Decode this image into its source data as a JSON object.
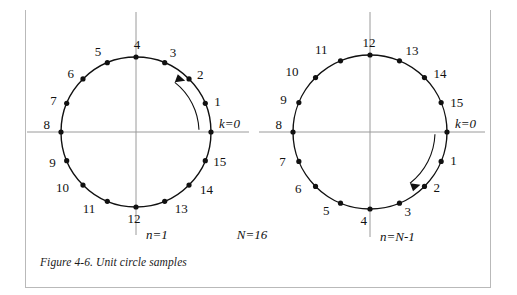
{
  "figure": {
    "caption": "Figure 4-6. Unit circle samples",
    "n_label_total": "N=16",
    "accent_color": "#111111",
    "axis_color": "#9a9a9a"
  },
  "circles": [
    {
      "id": "left-circle",
      "direction": "counterclockwise",
      "direction_label": "n=1",
      "origin_label": "k=0",
      "cx": 136,
      "cy": 132,
      "r": 75,
      "samples": [
        {
          "k": "k=0",
          "index": 0,
          "angle_deg": 0,
          "label": "k=0",
          "label_dx": 8,
          "label_dy": -4
        },
        {
          "k": "1",
          "index": 1,
          "angle_deg": 22.5,
          "label": "1",
          "label_dx": 9,
          "label_dy": 3
        },
        {
          "k": "2",
          "index": 2,
          "angle_deg": 45,
          "label": "2",
          "label_dx": 8,
          "label_dy": 0
        },
        {
          "k": "3",
          "index": 3,
          "angle_deg": 67.5,
          "label": "3",
          "label_dx": 5,
          "label_dy": -6
        },
        {
          "k": "4",
          "index": 4,
          "angle_deg": 90,
          "label": "4",
          "label_dx": 1,
          "label_dy": -8
        },
        {
          "k": "5",
          "index": 5,
          "angle_deg": 112.5,
          "label": "5",
          "label_dx": -6,
          "label_dy": -7
        },
        {
          "k": "6",
          "index": 6,
          "angle_deg": 135,
          "label": "6",
          "label_dx": -9,
          "label_dy": -1
        },
        {
          "k": "7",
          "index": 7,
          "angle_deg": 157.5,
          "label": "7",
          "label_dx": -10,
          "label_dy": 2
        },
        {
          "k": "8",
          "index": 8,
          "angle_deg": 180,
          "label": "8",
          "label_dx": -11,
          "label_dy": -3
        },
        {
          "k": "9",
          "index": 9,
          "angle_deg": 202.5,
          "label": "9",
          "label_dx": -11,
          "label_dy": 6
        },
        {
          "k": "10",
          "index": 10,
          "angle_deg": 225,
          "label": "10",
          "label_dx": -14,
          "label_dy": 7
        },
        {
          "k": "11",
          "index": 11,
          "angle_deg": 247.5,
          "label": "11",
          "label_dx": -12,
          "label_dy": 12
        },
        {
          "k": "12",
          "index": 12,
          "angle_deg": 270,
          "label": "12",
          "label_dx": -2,
          "label_dy": 16
        },
        {
          "k": "13",
          "index": 13,
          "angle_deg": 292.5,
          "label": "13",
          "label_dx": 10,
          "label_dy": 12
        },
        {
          "k": "14",
          "index": 14,
          "angle_deg": 315,
          "label": "14",
          "label_dx": 11,
          "label_dy": 9
        },
        {
          "k": "15",
          "index": 15,
          "angle_deg": 337.5,
          "label": "15",
          "label_dx": 8,
          "label_dy": 5
        }
      ]
    },
    {
      "id": "right-circle",
      "direction": "clockwise",
      "direction_label": "n=N-1",
      "origin_label": "k=0",
      "cx": 370,
      "cy": 132,
      "r": 77,
      "samples": [
        {
          "k": "k=0",
          "index": 0,
          "angle_deg": 0,
          "label": "k=0",
          "label_dx": 8,
          "label_dy": -4
        },
        {
          "k": "1",
          "index": 1,
          "angle_deg": -22.5,
          "label": "1",
          "label_dx": 9,
          "label_dy": 4
        },
        {
          "k": "2",
          "index": 2,
          "angle_deg": -45,
          "label": "2",
          "label_dx": 9,
          "label_dy": 6
        },
        {
          "k": "3",
          "index": 3,
          "angle_deg": -67.5,
          "label": "3",
          "label_dx": 5,
          "label_dy": 13
        },
        {
          "k": "4",
          "index": 4,
          "angle_deg": -90,
          "label": "4",
          "label_dx": -3,
          "label_dy": 16
        },
        {
          "k": "5",
          "index": 5,
          "angle_deg": -112.5,
          "label": "5",
          "label_dx": -11,
          "label_dy": 12
        },
        {
          "k": "6",
          "index": 6,
          "angle_deg": -135,
          "label": "6",
          "label_dx": -14,
          "label_dy": 7
        },
        {
          "k": "7",
          "index": 7,
          "angle_deg": -157.5,
          "label": "7",
          "label_dx": -13,
          "label_dy": 5
        },
        {
          "k": "8",
          "index": 8,
          "angle_deg": 180,
          "label": "8",
          "label_dx": -11,
          "label_dy": -3
        },
        {
          "k": "9",
          "index": 9,
          "angle_deg": 157.5,
          "label": "9",
          "label_dx": -12,
          "label_dy": 1
        },
        {
          "k": "10",
          "index": 10,
          "angle_deg": 135,
          "label": "10",
          "label_dx": -17,
          "label_dy": -2
        },
        {
          "k": "11",
          "index": 11,
          "angle_deg": 112.5,
          "label": "11",
          "label_dx": -13,
          "label_dy": -7
        },
        {
          "k": "12",
          "index": 12,
          "angle_deg": 90,
          "label": "12",
          "label_dx": -1,
          "label_dy": -8
        },
        {
          "k": "13",
          "index": 13,
          "angle_deg": 67.5,
          "label": "13",
          "label_dx": 6,
          "label_dy": -6
        },
        {
          "k": "14",
          "index": 14,
          "angle_deg": 45,
          "label": "14",
          "label_dx": 9,
          "label_dy": 0
        },
        {
          "k": "15",
          "index": 15,
          "angle_deg": 22.5,
          "label": "15",
          "label_dx": 9,
          "label_dy": 4
        }
      ]
    }
  ]
}
